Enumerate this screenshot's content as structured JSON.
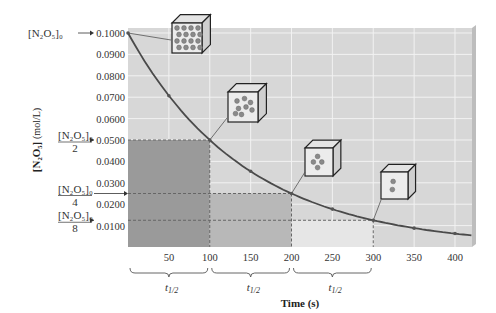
{
  "chart_data": {
    "type": "line",
    "title": "",
    "xlabel": "Time (s)",
    "ylabel": "[N2O5] (mol/L)",
    "xlim": [
      0,
      420
    ],
    "ylim": [
      0,
      0.1
    ],
    "x_ticks": [
      "50",
      "100",
      "150",
      "200",
      "250",
      "300",
      "350",
      "400"
    ],
    "y_ticks": [
      "0.0100",
      "0.0200",
      "0.0300",
      "0.0400",
      "0.0500",
      "0.0600",
      "0.0700",
      "0.0800",
      "0.0900",
      "0.1000"
    ],
    "grid": true,
    "series": [
      {
        "name": "[N2O5] decay",
        "x": [
          0,
          50,
          100,
          150,
          200,
          250,
          300,
          350,
          400
        ],
        "y": [
          0.1,
          0.0707,
          0.05,
          0.0354,
          0.025,
          0.0177,
          0.0125,
          0.0088,
          0.0063
        ]
      }
    ],
    "annotations": {
      "y_markers": [
        {
          "label": "[N2O5]0",
          "value": 0.1
        },
        {
          "label": "[N2O5]0 / 2",
          "value": 0.05
        },
        {
          "label": "[N2O5]0 / 4",
          "value": 0.025
        },
        {
          "label": "[N2O5]0 / 8",
          "value": 0.0125
        }
      ],
      "half_life_brackets": [
        {
          "from": 0,
          "to": 100,
          "label": "t1/2"
        },
        {
          "from": 100,
          "to": 200,
          "label": "t1/2"
        },
        {
          "from": 200,
          "to": 300,
          "label": "t1/2"
        }
      ],
      "molecule_cubes": [
        {
          "at_time": 0,
          "molecules": 16
        },
        {
          "at_time": 100,
          "molecules": 8
        },
        {
          "at_time": 200,
          "molecules": 4
        },
        {
          "at_time": 300,
          "molecules": 2
        }
      ]
    }
  },
  "labels": {
    "xlabel": "Time (s)",
    "ylabel_main": "[N₂O₅]",
    "ylabel_unit": "(mol/L)",
    "conc0": "[N₂O₅]₀",
    "den2": "2",
    "den4": "4",
    "den8": "8",
    "half": "t",
    "half_sub": "1/2"
  },
  "colors": {
    "plot_bg": "#d7d7d7",
    "grid": "#f2f2f2",
    "curve": "#4a4a4a",
    "shade_dark": "#9a9a9a",
    "shade_mid": "#b8b8b8",
    "shade_light": "#e6e6e6"
  }
}
